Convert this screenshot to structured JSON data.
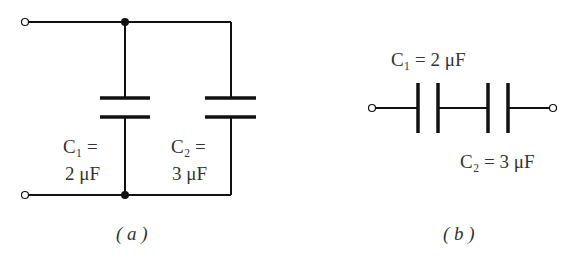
{
  "diagram": {
    "type": "circuit",
    "panel_a": {
      "caption": "( a )",
      "description": "Two capacitors in parallel",
      "c1": {
        "line1": "C₁ =",
        "line2": "2 μF",
        "name": "C1",
        "value_uF": 2
      },
      "c2": {
        "line1": "C₂ =",
        "line2": "3 μF",
        "name": "C2",
        "value_uF": 3
      }
    },
    "panel_b": {
      "caption": "( b )",
      "description": "Two capacitors in series",
      "c1": {
        "label": "C₁ = 2 μF",
        "name": "C1",
        "value_uF": 2
      },
      "c2": {
        "label": "C₂ = 3 μF",
        "name": "C2",
        "value_uF": 3
      }
    },
    "colors": {
      "wire": "#111111",
      "text": "#333333",
      "background": "#ffffff"
    }
  }
}
